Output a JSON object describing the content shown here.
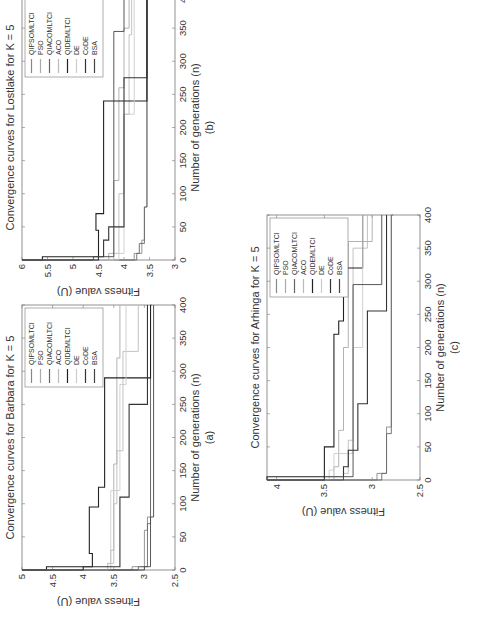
{
  "chart_data": [
    {
      "type": "line",
      "panel_label": "(a)",
      "title": "Convergence curves for Barbara for K = 5",
      "xlabel": "Number of generations (n)",
      "ylabel": "Fitness value (U)",
      "xlim": [
        0,
        400
      ],
      "ylim": [
        2.5,
        5
      ],
      "xticks": [
        0,
        50,
        100,
        150,
        200,
        250,
        300,
        350,
        400
      ],
      "yticks": [
        2.5,
        3,
        3.5,
        4,
        4.5,
        5
      ],
      "legend_position": "upper right",
      "series": [
        {
          "name": "QIPSOMLTCI",
          "color": "#888888",
          "x": [
            0,
            5,
            60,
            80,
            400
          ],
          "y": [
            3.2,
            3.0,
            2.95,
            2.9,
            2.9
          ]
        },
        {
          "name": "PSO",
          "color": "#aaaaaa",
          "x": [
            0,
            10,
            30,
            160,
            320,
            400
          ],
          "y": [
            3.6,
            3.55,
            3.5,
            3.45,
            3.4,
            3.4
          ]
        },
        {
          "name": "QIACOMLTCI",
          "color": "#666666",
          "x": [
            0,
            5,
            70,
            400
          ],
          "y": [
            3.1,
            2.95,
            2.9,
            2.88
          ]
        },
        {
          "name": "ACO",
          "color": "#bbbbbb",
          "x": [
            0,
            10,
            100,
            180,
            330,
            400
          ],
          "y": [
            3.55,
            3.5,
            3.45,
            3.35,
            3.1,
            3.1
          ]
        },
        {
          "name": "QIDEMLTCI",
          "color": "#222222",
          "x": [
            0,
            5,
            25,
            95,
            125,
            290,
            400
          ],
          "y": [
            4.6,
            3.85,
            3.9,
            3.75,
            3.65,
            2.9,
            2.9
          ]
        },
        {
          "name": "DE",
          "color": "#cccccc",
          "x": [
            0,
            10,
            120,
            280,
            400
          ],
          "y": [
            3.6,
            3.55,
            3.4,
            3.3,
            3.25
          ]
        },
        {
          "name": "CoDE",
          "color": "#333333",
          "x": [
            0,
            5,
            110,
            250,
            400
          ],
          "y": [
            4.0,
            3.4,
            3.25,
            2.95,
            2.95
          ]
        },
        {
          "name": "BSA",
          "color": "#444444",
          "x": [
            0,
            5,
            80,
            400
          ],
          "y": [
            3.0,
            2.9,
            2.85,
            2.85
          ]
        }
      ]
    },
    {
      "type": "line",
      "panel_label": "(b)",
      "title": "Convergence curves for Lostlake for K = 5",
      "xlabel": "Number of generations (n)",
      "ylabel": "Fitness value (U)",
      "xlim": [
        0,
        400
      ],
      "ylim": [
        3,
        6
      ],
      "xticks": [
        0,
        50,
        100,
        150,
        200,
        250,
        300,
        350,
        400
      ],
      "yticks": [
        3,
        3.5,
        4,
        4.5,
        5,
        5.5,
        6
      ],
      "legend_position": "upper right",
      "series": [
        {
          "name": "QIPSOMLTCI",
          "color": "#888888",
          "x": [
            0,
            10,
            30,
            80,
            400
          ],
          "y": [
            3.8,
            3.65,
            3.6,
            3.55,
            3.55
          ]
        },
        {
          "name": "PSO",
          "color": "#aaaaaa",
          "x": [
            0,
            10,
            120,
            260,
            350,
            400
          ],
          "y": [
            4.3,
            4.2,
            4.1,
            4.0,
            3.9,
            3.9
          ]
        },
        {
          "name": "QIACOMLTCI",
          "color": "#666666",
          "x": [
            0,
            10,
            25,
            80,
            400
          ],
          "y": [
            3.75,
            3.7,
            3.6,
            3.55,
            3.55
          ]
        },
        {
          "name": "ACO",
          "color": "#bbbbbb",
          "x": [
            0,
            10,
            100,
            220,
            340,
            400
          ],
          "y": [
            4.2,
            4.1,
            4.0,
            3.9,
            3.85,
            3.85
          ]
        },
        {
          "name": "QIDEMLTCI",
          "color": "#222222",
          "x": [
            0,
            5,
            45,
            70,
            240,
            400
          ],
          "y": [
            5.6,
            4.5,
            4.55,
            4.4,
            3.55,
            3.55
          ]
        },
        {
          "name": "DE",
          "color": "#cccccc",
          "x": [
            0,
            10,
            220,
            400
          ],
          "y": [
            4.1,
            4.0,
            3.8,
            3.8
          ]
        },
        {
          "name": "CoDE",
          "color": "#333333",
          "x": [
            0,
            5,
            30,
            50,
            275,
            400
          ],
          "y": [
            4.5,
            4.4,
            4.3,
            4.0,
            3.55,
            3.55
          ]
        },
        {
          "name": "BSA",
          "color": "#444444",
          "x": [
            0,
            5,
            345,
            400
          ],
          "y": [
            4.6,
            4.2,
            4.0,
            3.5
          ]
        }
      ]
    },
    {
      "type": "line",
      "panel_label": "(c)",
      "title": "Convergence curves for Arhinga for K = 5",
      "xlabel": "Number of generations (n)",
      "ylabel": "Fitness value (U)",
      "xlim": [
        0,
        400
      ],
      "ylim": [
        2.5,
        4.1
      ],
      "xticks": [
        0,
        50,
        100,
        150,
        200,
        250,
        300,
        350,
        400
      ],
      "yticks": [
        2.5,
        3,
        3.5,
        4
      ],
      "legend_position": "upper right",
      "series": [
        {
          "name": "QIPSOMLTCI",
          "color": "#888888",
          "x": [
            0,
            10,
            80,
            400
          ],
          "y": [
            2.95,
            2.85,
            2.8,
            2.8
          ]
        },
        {
          "name": "PSO",
          "color": "#aaaaaa",
          "x": [
            0,
            20,
            75,
            200,
            360,
            400
          ],
          "y": [
            3.4,
            3.35,
            3.3,
            3.25,
            3.0,
            3.0
          ]
        },
        {
          "name": "QIACOMLTCI",
          "color": "#666666",
          "x": [
            0,
            10,
            70,
            400
          ],
          "y": [
            2.9,
            2.85,
            2.8,
            2.78
          ]
        },
        {
          "name": "ACO",
          "color": "#bbbbbb",
          "x": [
            0,
            10,
            60,
            350,
            400
          ],
          "y": [
            3.3,
            3.25,
            3.2,
            3.05,
            3.05
          ]
        },
        {
          "name": "QIDEMLTCI",
          "color": "#222222",
          "x": [
            0,
            5,
            50,
            220,
            240,
            320,
            400
          ],
          "y": [
            4.1,
            3.5,
            3.4,
            3.35,
            3.3,
            3.1,
            3.1
          ]
        },
        {
          "name": "DE",
          "color": "#cccccc",
          "x": [
            0,
            15,
            40,
            200,
            400
          ],
          "y": [
            3.45,
            3.4,
            3.2,
            3.1,
            3.1
          ]
        },
        {
          "name": "CoDE",
          "color": "#333333",
          "x": [
            0,
            5,
            20,
            45,
            115,
            255,
            400
          ],
          "y": [
            3.5,
            3.3,
            3.25,
            3.15,
            3.05,
            2.85,
            2.85
          ]
        },
        {
          "name": "BSA",
          "color": "#444444",
          "x": [
            0,
            5,
            295,
            400
          ],
          "y": [
            3.3,
            3.2,
            2.9,
            2.9
          ]
        }
      ]
    }
  ],
  "panels": {
    "a": {
      "title": "Convergence curves for Barbara for K = 5",
      "label": "(a)"
    },
    "b": {
      "title": "Convergence curves for Lostlake for K = 5",
      "label": "(b)"
    },
    "c": {
      "title": "Convergence curves for Arhinga for K = 5",
      "label": "(c)"
    }
  },
  "axis": {
    "xlabel": "Number of generations (n)",
    "ylabel": "Fitness value (U)"
  },
  "legend": [
    "QIPSOMLTCI",
    "PSO",
    "QIACOMLTCI",
    "ACO",
    "QIDEMLTCI",
    "DE",
    "CoDE",
    "BSA"
  ]
}
